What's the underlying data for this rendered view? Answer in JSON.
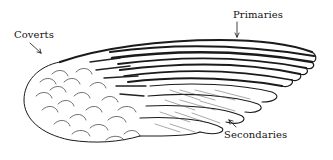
{
  "figure": {
    "labels": {
      "coverts": "Coverts",
      "primaries": "Primaries",
      "secondaries": "Secondaries"
    }
  },
  "colors": {
    "ink": "#111111",
    "background": "#ffffff"
  }
}
